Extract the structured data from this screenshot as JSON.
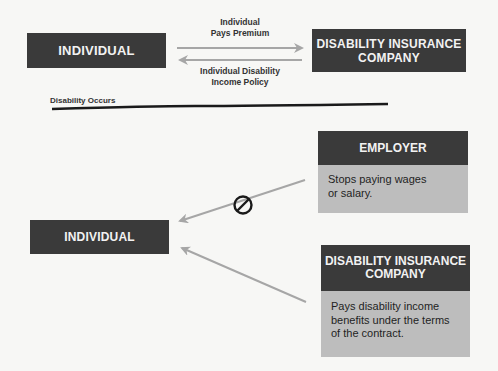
{
  "top_section": {
    "individual_label": "INDIVIDUAL",
    "company_label_line1": "DISABILITY INSURANCE",
    "company_label_line2": "COMPANY",
    "arrow_right_label_line1": "Individual",
    "arrow_right_label_line2": "Pays Premium",
    "arrow_left_label_line1": "Individual Disability",
    "arrow_left_label_line2": "Income Policy"
  },
  "divider": {
    "label": "Disability Occurs"
  },
  "bottom_section": {
    "individual_label": "INDIVIDUAL",
    "employer_card": {
      "title": "EMPLOYER",
      "body": "Stops paying wages or salary."
    },
    "company_card": {
      "title_line1": "DISABILITY INSURANCE",
      "title_line2": "COMPANY",
      "body": "Pays disability income benefits under the terms of the contract."
    }
  },
  "colors": {
    "dark_box": "#3a3a3a",
    "card_body": "#bdbdbd",
    "arrow": "#a6a6a6",
    "background": "#f7f7f5"
  }
}
